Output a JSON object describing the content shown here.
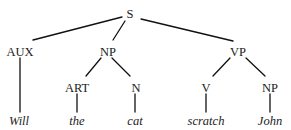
{
  "diagram": {
    "type": "syntax-tree",
    "nodes": {
      "s": {
        "label": "S"
      },
      "aux": {
        "label": "AUX"
      },
      "np1": {
        "label": "NP"
      },
      "vp": {
        "label": "VP"
      },
      "art": {
        "label": "ART"
      },
      "n": {
        "label": "N"
      },
      "v": {
        "label": "V"
      },
      "np2": {
        "label": "NP"
      }
    },
    "leaves": {
      "will": {
        "label": "Will"
      },
      "the": {
        "label": "the"
      },
      "cat": {
        "label": "cat"
      },
      "scratch": {
        "label": "scratch"
      },
      "john": {
        "label": "John"
      }
    },
    "edges": [
      [
        "S",
        "AUX"
      ],
      [
        "S",
        "NP"
      ],
      [
        "S",
        "VP"
      ],
      [
        "AUX",
        "Will"
      ],
      [
        "NP",
        "ART"
      ],
      [
        "NP",
        "N"
      ],
      [
        "ART",
        "the"
      ],
      [
        "N",
        "cat"
      ],
      [
        "VP",
        "V"
      ],
      [
        "VP",
        "NP"
      ],
      [
        "V",
        "scratch"
      ],
      [
        "NP",
        "John"
      ]
    ]
  }
}
